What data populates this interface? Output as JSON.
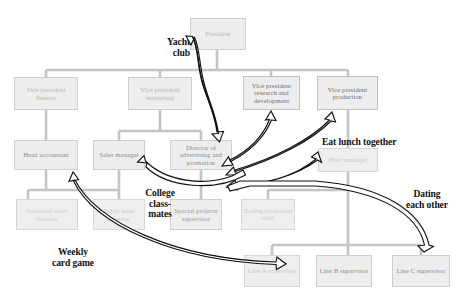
{
  "diagram": {
    "box_fill": "#ededed",
    "box_text_color": "#b6b6b6",
    "connector_color": "#c4c4c4",
    "annotation_color": "#111111"
  },
  "boxes": [
    {
      "id": "president",
      "label": "President",
      "level": 0
    },
    {
      "id": "vp_finance",
      "label": "Vice president finance",
      "level": 1
    },
    {
      "id": "vp_marketing",
      "label": "Vice president marketing",
      "level": 1
    },
    {
      "id": "vp_research",
      "label": "Vice president research and development",
      "level": 1
    },
    {
      "id": "vp_production",
      "label": "Vice president production",
      "level": 1
    },
    {
      "id": "head_accountant",
      "label": "Head accountant",
      "level": 2
    },
    {
      "id": "sales_manager",
      "label": "Sales manager",
      "level": 2
    },
    {
      "id": "director_advertising",
      "label": "Director of advertising and promotion",
      "level": 2
    },
    {
      "id": "plant_manager",
      "label": "Plant manager",
      "level": 2
    },
    {
      "id": "industrial_sales",
      "label": "Industrial sales director",
      "level": 3
    },
    {
      "id": "retail_sales",
      "label": "Retail sales director",
      "level": 3
    },
    {
      "id": "special_projects",
      "label": "Special projects supervisor",
      "level": 3
    },
    {
      "id": "tooling_chief",
      "label": "Tooling production chief",
      "level": 3
    },
    {
      "id": "line_a",
      "label": "Line A supervisor",
      "level": 4
    },
    {
      "id": "line_b",
      "label": "Line B supervisor",
      "level": 4
    },
    {
      "id": "line_c",
      "label": "Line C supervisor",
      "level": 4
    }
  ],
  "annotations": [
    {
      "id": "yacht_club",
      "label": "Yacht\nclub"
    },
    {
      "id": "eat_lunch",
      "label": "Eat lunch together"
    },
    {
      "id": "college_classmates",
      "label": "College\nclass-\nmates"
    },
    {
      "id": "dating",
      "label": "Dating\neach other"
    },
    {
      "id": "weekly_card_game",
      "label": "Weekly\ncard game"
    }
  ]
}
